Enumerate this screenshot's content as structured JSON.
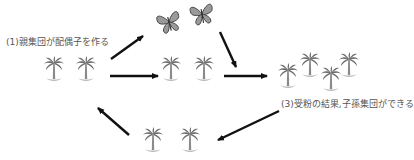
{
  "diagram": {
    "type": "cycle",
    "steps": [
      {
        "id": "step1",
        "label": "(1)親集団が配偶子を作る",
        "node": "parent-population"
      },
      {
        "id": "step2",
        "node": "pollinators",
        "description": "butterflies (pollinators)"
      },
      {
        "id": "step3",
        "label": "(3)受粉の結果,子孫集団ができる",
        "node": "offspring-population"
      }
    ],
    "nodes": [
      {
        "id": "parent-population",
        "icon": "palm-tree-icon",
        "count": 2
      },
      {
        "id": "gamete-population",
        "icon": "palm-tree-icon",
        "count": 2
      },
      {
        "id": "butterflies",
        "icon": "butterfly-icon",
        "count": 2
      },
      {
        "id": "offspring-population",
        "icon": "palm-tree-icon",
        "count": 4
      },
      {
        "id": "next-parent-population",
        "icon": "palm-tree-icon",
        "count": 2
      }
    ],
    "edges": [
      {
        "from": "parent-population",
        "to": "butterflies"
      },
      {
        "from": "parent-population",
        "to": "gamete-population"
      },
      {
        "from": "butterflies",
        "to": "offspring-population"
      },
      {
        "from": "gamete-population",
        "to": "offspring-population"
      },
      {
        "from": "offspring-population",
        "to": "next-parent-population"
      },
      {
        "from": "next-parent-population",
        "to": "parent-population"
      }
    ],
    "colors": {
      "arrow": "#111111",
      "palm_crown": "#6a6a6a",
      "palm_base": "#b8b8b8",
      "butterfly_fill": "#9a9a9a",
      "butterfly_stroke": "#333333",
      "text": "#555555"
    }
  }
}
